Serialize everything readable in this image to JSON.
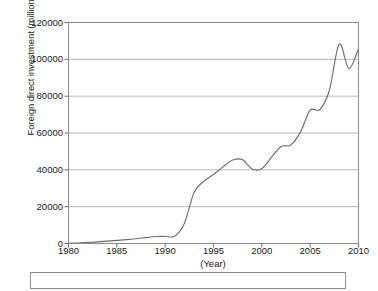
{
  "chart_data": {
    "type": "line",
    "title": "",
    "subtitle": "",
    "xlabel": "(Year)",
    "ylabel": "Foreign direct investment (million US$)",
    "xlim": [
      1980,
      2010
    ],
    "ylim": [
      0,
      120000
    ],
    "grid": true,
    "legend": null,
    "legend_position": "none",
    "xticks": [
      1980,
      1985,
      1990,
      1995,
      2000,
      2005,
      2010
    ],
    "xtick_labels": [
      "1980",
      "1985",
      "1990",
      "1995",
      "2000",
      "2005",
      "2010"
    ],
    "yticks": [
      0,
      20000,
      40000,
      60000,
      80000,
      100000,
      120000
    ],
    "ytick_labels": [
      "0",
      "20000",
      "40000",
      "60000",
      "80000",
      "100000",
      "120000"
    ],
    "series": [
      {
        "name": "Foreign direct investment",
        "color": "#6b6b6b",
        "x": [
          1980,
          1981,
          1982,
          1983,
          1984,
          1985,
          1986,
          1987,
          1988,
          1989,
          1990,
          1991,
          1992,
          1993,
          1994,
          1995,
          1996,
          1997,
          1998,
          1999,
          2000,
          2001,
          2002,
          2003,
          2004,
          2005,
          2006,
          2007,
          2008,
          2009,
          2010
        ],
        "values": [
          100,
          300,
          600,
          900,
          1300,
          1700,
          2100,
          2600,
          3200,
          3800,
          3900,
          4000,
          11000,
          27800,
          33800,
          37500,
          41700,
          45300,
          45500,
          40400,
          40700,
          46900,
          52700,
          53500,
          60600,
          72400,
          72700,
          83500,
          108300,
          95000,
          105700
        ]
      }
    ],
    "annotations": []
  },
  "caption": {
    "text": ""
  }
}
